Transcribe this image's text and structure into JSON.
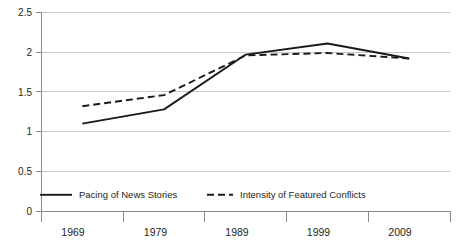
{
  "chart_data": {
    "type": "line",
    "title": "",
    "subtitle": "",
    "xlabel": "",
    "ylabel": "",
    "categories": [
      "1969",
      "1979",
      "1989",
      "1999",
      "2009"
    ],
    "x": [
      1969,
      1979,
      1989,
      1999,
      2009
    ],
    "series": [
      {
        "name": "Pacing of News Stories",
        "style": "solid",
        "values": [
          1.1,
          1.28,
          1.97,
          2.11,
          1.92
        ]
      },
      {
        "name": "Intensity of Featured Conflicts",
        "style": "dashed",
        "values": [
          1.32,
          1.46,
          1.96,
          1.99,
          1.92
        ]
      }
    ],
    "ylim": [
      0,
      2.5
    ],
    "yticks": [
      0,
      0.5,
      1,
      1.5,
      2,
      2.5
    ],
    "ytick_labels": [
      "0",
      "0.5",
      "1",
      "1.5",
      "2",
      "2.5"
    ],
    "xtick_labels": [
      "1969",
      "1979",
      "1989",
      "1999",
      "2009"
    ],
    "grid": true,
    "grid_axis": "y",
    "legend_position": "inside-bottom",
    "colors": {
      "line": "#1a1a1a",
      "gridline": "#c9c9c9",
      "axis": "#8a8a8a",
      "background": "#ffffff",
      "text": "#231f20"
    }
  },
  "legend": {
    "entries": [
      {
        "label": "Pacing of News Stories",
        "style": "solid"
      },
      {
        "label": "Intensity of Featured Conflicts",
        "style": "dashed"
      }
    ]
  },
  "axes": {
    "y_labels": [
      "2.5",
      "2",
      "1.5",
      "1",
      "0.5",
      "0"
    ],
    "x_labels": [
      "1969",
      "1979",
      "1989",
      "1999",
      "2009"
    ]
  }
}
